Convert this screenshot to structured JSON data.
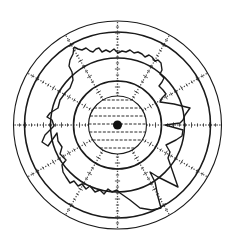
{
  "diagram": {
    "type": "polar-plot",
    "center": [
      117.5,
      125
    ],
    "rings": [
      {
        "name": "ring-outer",
        "r": 104,
        "stroke_width": 1.1
      },
      {
        "name": "ring-2",
        "r": 93,
        "stroke_width": 1.6
      },
      {
        "name": "ring-3",
        "r": 67,
        "stroke_width": 1.5
      },
      {
        "name": "ring-4",
        "r": 44,
        "stroke_width": 1.6
      },
      {
        "name": "ring-inner",
        "r": 29,
        "stroke_width": 1.1
      }
    ],
    "spokes": {
      "count": 12,
      "step_deg": 30,
      "inner_r": 29,
      "outer_r": 104
    },
    "hatch": {
      "region_r": 29,
      "line_spacing": 8
    },
    "center_dot_r": 4.5,
    "trace_points": "74,47 78,49 82,50 86,48 90,51 93,52 96,49 99,48 102,52 106,50 110,52 114,49 118,53 122,51 126,52 130,50 134,53 138,52 142,54 145,57 149,55 152,57 155,61 158,60 161,63 162,70 160,74 164,78 162,82 159,86 163,90 166,94 162,98 160,102 174,104 190,108 185,115 183,120 180,123 165,125 183,130 182,136 176,140 166,145 170,152 168,158 178,187 158,177 150,172 155,182 158,197 161,208 152,210 140,208 130,200 120,193 117,190 112,192 108,189 104,194 100,190 95,192 90,186 86,189 82,184 78,186 74,181 70,183 66,177 63,172 62,165 66,160 60,154 62,147 58,141 57,133 48,146 42,142 45,135 50,130 54,126 52,120 47,117 50,113 58,108 60,100 63,96 66,92 70,88 73,80 72,72 69,66 70,60 73,54 74,47"
  }
}
